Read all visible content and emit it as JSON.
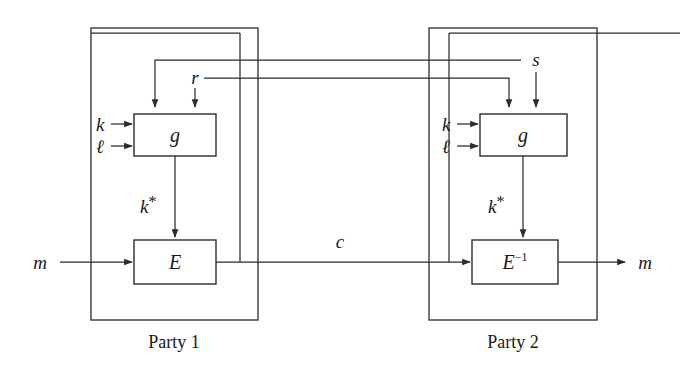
{
  "diagram": {
    "type": "block-diagram",
    "canvas": {
      "width": 680,
      "height": 381,
      "background": "#ffffff"
    },
    "stroke_color": "#2b2b2b",
    "frame_color": "#3a3a3a",
    "parties": [
      {
        "id": "party1",
        "caption": "Party 1"
      },
      {
        "id": "party2",
        "caption": "Party 2"
      }
    ],
    "blocks": [
      {
        "id": "g-left",
        "label": "g"
      },
      {
        "id": "g-right",
        "label": "g"
      },
      {
        "id": "e-left",
        "label": "E"
      },
      {
        "id": "e-right",
        "label": "E",
        "superscript": "−1"
      }
    ],
    "signals": {
      "k_left": "k",
      "l_left": "ℓ",
      "k_right": "k",
      "l_right": "ℓ",
      "r": "r",
      "s": "s",
      "kstar_left": "k",
      "kstar_left_star": "*",
      "kstar_right": "k",
      "kstar_right_star": "*",
      "m_in": "m",
      "m_out": "m",
      "c": "c"
    }
  }
}
